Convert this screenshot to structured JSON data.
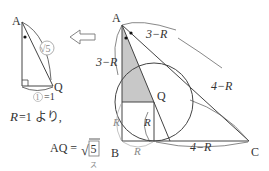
{
  "left_figure": {
    "vertex_A": "A",
    "vertex_Q": "Q",
    "hypotenuse_label": "√5",
    "base_label_circled": "1",
    "base_label_eq": "=1"
  },
  "arrow": {
    "direction": "left"
  },
  "main_figure": {
    "vertex_A": "A",
    "vertex_B": "B",
    "vertex_C": "C",
    "vertex_Q": "Q",
    "label_AB_upper": "3−R",
    "label_AC_upper": "3−R",
    "label_AC_lower": "4−R",
    "label_BC_right": "4−R",
    "label_R_left": "R",
    "label_R_bottom": "R",
    "label_R_center": "R",
    "colors": {
      "shade": "#c8c8c8",
      "line": "#444444",
      "grey_text": "#888888"
    }
  },
  "text": {
    "line1_var": "R",
    "line1_rest": "=1 より,",
    "line2_lhs": "AQ =",
    "line2_sqrt": "√",
    "line2_boxed": "5",
    "line2_sub": "ス"
  }
}
